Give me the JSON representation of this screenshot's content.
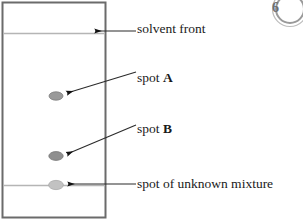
{
  "diagram": {
    "plate": {
      "border_color": "#6b6b6b",
      "fill_color": "#ffffff",
      "solvent_front_line_color": "#b5b5b5",
      "baseline_color": "#b5b5b5"
    },
    "spots": [
      {
        "id": "spot-a",
        "label": "spot A",
        "color": "#9a9a9a",
        "edge_color": "#7d7d7d"
      },
      {
        "id": "spot-b",
        "label": "spot B",
        "color": "#8f8f8f",
        "edge_color": "#767676"
      },
      {
        "id": "spot-unknown",
        "label": "spot of unknown mixture",
        "color": "#c2c2c2",
        "edge_color": "#a8a8a8"
      }
    ],
    "labels": {
      "solvent_front": "solvent front",
      "spot_a_prefix": "spot ",
      "spot_a_name": "A",
      "spot_b_prefix": "spot ",
      "spot_b_name": "B",
      "unknown_mixture": "spot of unknown mixture"
    },
    "annotations": {
      "leader_line_color": "#2b2b2b",
      "arrow_color": "#111111"
    },
    "badge": {
      "text": "6",
      "color": "#6e6e6e"
    }
  }
}
